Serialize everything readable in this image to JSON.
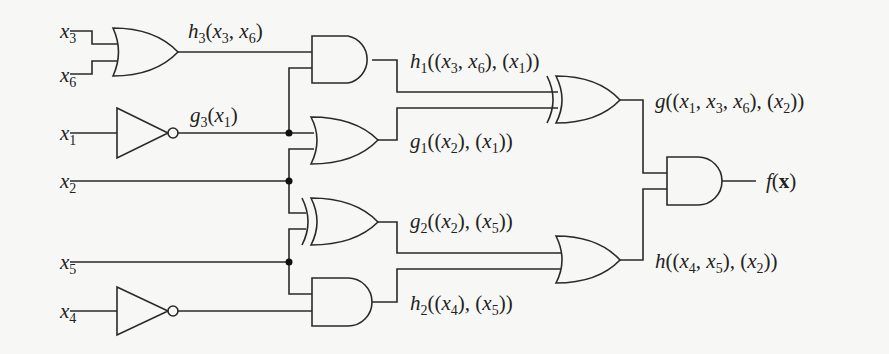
{
  "diagram": {
    "type": "logic-circuit",
    "inputs": [
      {
        "id": "x3",
        "label": "x",
        "sub": "3"
      },
      {
        "id": "x6",
        "label": "x",
        "sub": "6"
      },
      {
        "id": "x1",
        "label": "x",
        "sub": "1"
      },
      {
        "id": "x2",
        "label": "x",
        "sub": "2"
      },
      {
        "id": "x5",
        "label": "x",
        "sub": "5"
      },
      {
        "id": "x4",
        "label": "x",
        "sub": "4"
      }
    ],
    "gates": [
      {
        "id": "h3",
        "type": "OR",
        "inputs": [
          "x3",
          "x6"
        ],
        "label": "h3(x3, x6)"
      },
      {
        "id": "g3",
        "type": "NOT",
        "inputs": [
          "x1"
        ],
        "label": "g3(x1)"
      },
      {
        "id": "not_x4",
        "type": "NOT",
        "inputs": [
          "x4"
        ]
      },
      {
        "id": "h1",
        "type": "AND",
        "inputs": [
          "h3",
          "g3"
        ],
        "label": "h1((x3, x6), (x1))"
      },
      {
        "id": "g1",
        "type": "OR",
        "inputs": [
          "g3",
          "x2"
        ],
        "label": "g1((x2), (x1))"
      },
      {
        "id": "g2",
        "type": "XOR",
        "inputs": [
          "x2",
          "x5"
        ],
        "label": "g2((x2), (x5))"
      },
      {
        "id": "h2",
        "type": "AND",
        "inputs": [
          "x5",
          "not_x4"
        ],
        "label": "h2((x4), (x5))"
      },
      {
        "id": "g",
        "type": "XOR",
        "inputs": [
          "h1",
          "g1"
        ],
        "label": "g((x1, x3, x6), (x2))"
      },
      {
        "id": "h",
        "type": "OR",
        "inputs": [
          "g2",
          "h2"
        ],
        "label": "h((x4, x5), (x2))"
      },
      {
        "id": "f",
        "type": "AND",
        "inputs": [
          "g",
          "h"
        ],
        "label": "f(x)"
      }
    ]
  },
  "labels": {
    "x3": {
      "base": "x",
      "sub": "3"
    },
    "x6": {
      "base": "x",
      "sub": "6"
    },
    "x1": {
      "base": "x",
      "sub": "1"
    },
    "x2": {
      "base": "x",
      "sub": "2"
    },
    "x5": {
      "base": "x",
      "sub": "5"
    },
    "x4": {
      "base": "x",
      "sub": "4"
    },
    "h3": {
      "fn": "h",
      "sub": "3",
      "args": "(x3, x6)"
    },
    "g3": {
      "fn": "g",
      "sub": "3",
      "args": "(x1)"
    },
    "h1": {
      "fn": "h",
      "sub": "1",
      "args": "((x3, x6), (x1))"
    },
    "g1": {
      "fn": "g",
      "sub": "1",
      "args": "((x2), (x1))"
    },
    "g2": {
      "fn": "g",
      "sub": "2",
      "args": "((x2), (x5))"
    },
    "h2": {
      "fn": "h",
      "sub": "2",
      "args": "((x4), (x5))"
    },
    "g": {
      "fn": "g",
      "args": "((x1, x3, x6), (x2))"
    },
    "h": {
      "fn": "h",
      "args": "((x4, x5), (x2))"
    },
    "f": {
      "fn": "f",
      "arg": "x"
    }
  },
  "text": {
    "x": "x",
    "s1": "1",
    "s2": "2",
    "s3": "3",
    "s4": "4",
    "s5": "5",
    "s6": "6",
    "lp": "(",
    "rp": ")",
    "comma": ", ",
    "h": "h",
    "g": "g",
    "f": "f",
    "bx": "x"
  }
}
